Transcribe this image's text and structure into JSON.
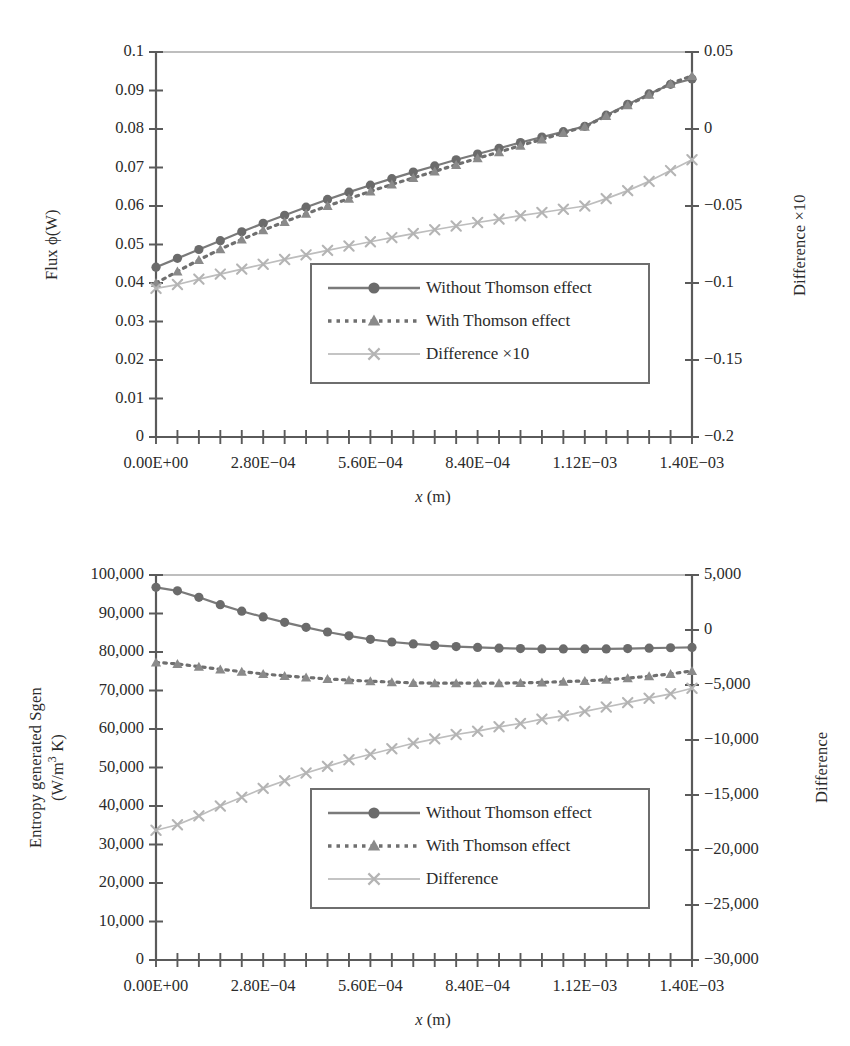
{
  "figure": {
    "panels": [
      "top",
      "bottom"
    ]
  },
  "chart_data": [
    {
      "id": "flux-chart",
      "type": "line",
      "title": "",
      "xlabel": "x (m)",
      "ylabel": "Flux ϕ(W)",
      "y2label": "Difference ×10",
      "xlim": [
        0,
        0.0014
      ],
      "ylim": [
        0,
        0.1
      ],
      "y2lim": [
        -0.2,
        0.05
      ],
      "grid": false,
      "legend_position": "lower-center-right",
      "xtick_labels": [
        "0.00E+00",
        "2.80E−04",
        "5.60E−04",
        "8.40E−04",
        "1.12E−03",
        "1.40E−03"
      ],
      "xtick_values": [
        0,
        0.00028,
        0.00056,
        0.00084,
        0.00112,
        0.0014
      ],
      "minor_tick_count": 25,
      "ytick_labels": [
        "0",
        "0.01",
        "0.02",
        "0.03",
        "0.04",
        "0.05",
        "0.06",
        "0.07",
        "0.08",
        "0.09",
        "0.1"
      ],
      "ytick_values": [
        0,
        0.01,
        0.02,
        0.03,
        0.04,
        0.05,
        0.06,
        0.07,
        0.08,
        0.09,
        0.1
      ],
      "y2tick_labels": [
        "−0.2",
        "−0.15",
        "−0.1",
        "−0.05",
        "0",
        "0.05"
      ],
      "y2tick_values": [
        -0.2,
        -0.15,
        -0.1,
        -0.05,
        0,
        0.05
      ],
      "x": [
        0,
        5.6e-05,
        0.000112,
        0.000168,
        0.000224,
        0.00028,
        0.000336,
        0.000392,
        0.000448,
        0.000504,
        0.00056,
        0.000616,
        0.000672,
        0.000728,
        0.000784,
        0.00084,
        0.000896,
        0.000952,
        0.001008,
        0.001064,
        0.00112,
        0.001176,
        0.001232,
        0.001288,
        0.001344,
        0.0014
      ],
      "series": [
        {
          "name": "Without Thomson effect",
          "axis": "left",
          "style": "solid",
          "marker": "circle",
          "color": "#7a7a7a",
          "values": [
            0.0441,
            0.0464,
            0.0487,
            0.051,
            0.0533,
            0.0555,
            0.0576,
            0.0597,
            0.0617,
            0.0636,
            0.0654,
            0.0671,
            0.0688,
            0.0704,
            0.072,
            0.0735,
            0.075,
            0.0765,
            0.0779,
            0.0793,
            0.0807,
            0.0836,
            0.0864,
            0.0891,
            0.0916,
            0.093
          ]
        },
        {
          "name": "With Thomson effect",
          "axis": "left",
          "style": "dotted",
          "marker": "triangle",
          "color": "#6f6f6f",
          "values": [
            0.04,
            0.043,
            0.046,
            0.0488,
            0.0513,
            0.0537,
            0.0559,
            0.058,
            0.06,
            0.0619,
            0.0638,
            0.0656,
            0.0673,
            0.069,
            0.0707,
            0.0724,
            0.074,
            0.0757,
            0.0773,
            0.079,
            0.0806,
            0.0834,
            0.0862,
            0.0889,
            0.0918,
            0.0938
          ]
        },
        {
          "name": "Difference ×10",
          "axis": "right",
          "style": "solid-light",
          "marker": "cross",
          "color": "#bdbdbd",
          "values": [
            -0.1035,
            -0.101,
            -0.0975,
            -0.0942,
            -0.091,
            -0.0878,
            -0.0847,
            -0.0817,
            -0.0788,
            -0.076,
            -0.0732,
            -0.0705,
            -0.0679,
            -0.0654,
            -0.063,
            -0.0607,
            -0.0585,
            -0.0563,
            -0.0542,
            -0.0521,
            -0.05,
            -0.0452,
            -0.04,
            -0.034,
            -0.027,
            -0.02
          ]
        }
      ],
      "legend": [
        {
          "label": "Without Thomson effect",
          "style": "solid",
          "marker": "circle"
        },
        {
          "label": "With Thomson effect",
          "style": "dotted",
          "marker": "triangle"
        },
        {
          "label": "Difference ×10",
          "style": "solid-light",
          "marker": "cross"
        }
      ]
    },
    {
      "id": "entropy-chart",
      "type": "line",
      "title": "",
      "xlabel": "x (m)",
      "ylabel": "Entropy generated Sgen (W/m³ K)",
      "ylabel_line1": "Entropy generated Sgen",
      "ylabel_line2": "(W/m³ K)",
      "y2label": "Difference",
      "xlim": [
        0,
        0.0014
      ],
      "ylim": [
        0,
        100000
      ],
      "y2lim": [
        -30000,
        5000
      ],
      "grid": false,
      "legend_position": "lower-center-right",
      "xtick_labels": [
        "0.00E+00",
        "2.80E−04",
        "5.60E−04",
        "8.40E−04",
        "1.12E−03",
        "1.40E−03"
      ],
      "xtick_values": [
        0,
        0.00028,
        0.00056,
        0.00084,
        0.00112,
        0.0014
      ],
      "minor_tick_count": 25,
      "ytick_labels": [
        "0",
        "10,000",
        "20,000",
        "30,000",
        "40,000",
        "50,000",
        "60,000",
        "70,000",
        "80,000",
        "90,000",
        "100,000"
      ],
      "ytick_values": [
        0,
        10000,
        20000,
        30000,
        40000,
        50000,
        60000,
        70000,
        80000,
        90000,
        100000
      ],
      "y2tick_labels": [
        "−30,000",
        "−25,000",
        "−20,000",
        "−15,000",
        "−10,000",
        "−5,000",
        "0",
        "5,000"
      ],
      "y2tick_values": [
        -30000,
        -25000,
        -20000,
        -15000,
        -10000,
        -5000,
        0,
        5000
      ],
      "x": [
        0,
        5.6e-05,
        0.000112,
        0.000168,
        0.000224,
        0.00028,
        0.000336,
        0.000392,
        0.000448,
        0.000504,
        0.00056,
        0.000616,
        0.000672,
        0.000728,
        0.000784,
        0.00084,
        0.000896,
        0.000952,
        0.001008,
        0.001064,
        0.00112,
        0.001176,
        0.001232,
        0.001288,
        0.001344,
        0.0014
      ],
      "series": [
        {
          "name": "Without Thomson effect",
          "axis": "left",
          "style": "solid",
          "marker": "circle",
          "color": "#7a7a7a",
          "values": [
            96800,
            95900,
            94200,
            92300,
            90600,
            89100,
            87700,
            86400,
            85200,
            84200,
            83300,
            82600,
            82100,
            81700,
            81400,
            81200,
            81000,
            80900,
            80800,
            80800,
            80800,
            80800,
            80900,
            81000,
            81100,
            81200
          ]
        },
        {
          "name": "With Thomson effect",
          "axis": "left",
          "style": "dotted",
          "marker": "triangle",
          "color": "#6f6f6f",
          "values": [
            77300,
            76900,
            76200,
            75500,
            74900,
            74300,
            73800,
            73400,
            73000,
            72700,
            72400,
            72200,
            72000,
            71900,
            71900,
            71900,
            71900,
            72000,
            72100,
            72300,
            72500,
            72800,
            73200,
            73700,
            74300,
            75100
          ]
        },
        {
          "name": "Difference",
          "axis": "right",
          "style": "solid-light",
          "marker": "cross",
          "color": "#bdbdbd",
          "values": [
            -18200,
            -17700,
            -16900,
            -16000,
            -15200,
            -14400,
            -13700,
            -13000,
            -12400,
            -11800,
            -11300,
            -10800,
            -10300,
            -9900,
            -9500,
            -9200,
            -8800,
            -8500,
            -8100,
            -7800,
            -7400,
            -7000,
            -6600,
            -6200,
            -5800,
            -5300
          ]
        }
      ],
      "legend": [
        {
          "label": "Without Thomson effect",
          "style": "solid",
          "marker": "circle"
        },
        {
          "label": "With Thomson effect",
          "style": "dotted",
          "marker": "triangle"
        },
        {
          "label": "Difference",
          "style": "solid-light",
          "marker": "cross"
        }
      ]
    }
  ],
  "colors": {
    "axis": "#5a5a5a",
    "series_dark": "#7a7a7a",
    "series_mid": "#6f6f6f",
    "series_light": "#bdbdbd",
    "text": "#2b2b2b",
    "legend_border": "#6e6e6e",
    "background": "#ffffff"
  }
}
